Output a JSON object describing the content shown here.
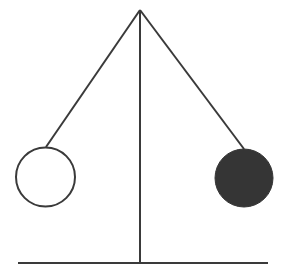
{
  "diagram": {
    "title": "",
    "colors": {
      "background": "#ffffff",
      "stroke": "#3a3a3a",
      "filled_ball": "#353535",
      "empty_ball": "#ffffff"
    },
    "pivot": {
      "x": 140,
      "y": 10
    },
    "vertical_post": {
      "x": 140,
      "y1": 10,
      "y2": 263
    },
    "base": {
      "x1": 18,
      "x2": 268,
      "y": 263
    },
    "pendulums": [
      {
        "name": "left-ball",
        "fill": "hollow",
        "cx": 45.5,
        "cy": 177,
        "r": 29.5,
        "attach": {
          "x": 46,
          "y": 147
        }
      },
      {
        "name": "right-ball",
        "fill": "solid",
        "cx": 244,
        "cy": 178,
        "r": 29,
        "attach": {
          "x": 244,
          "y": 149
        }
      }
    ]
  }
}
